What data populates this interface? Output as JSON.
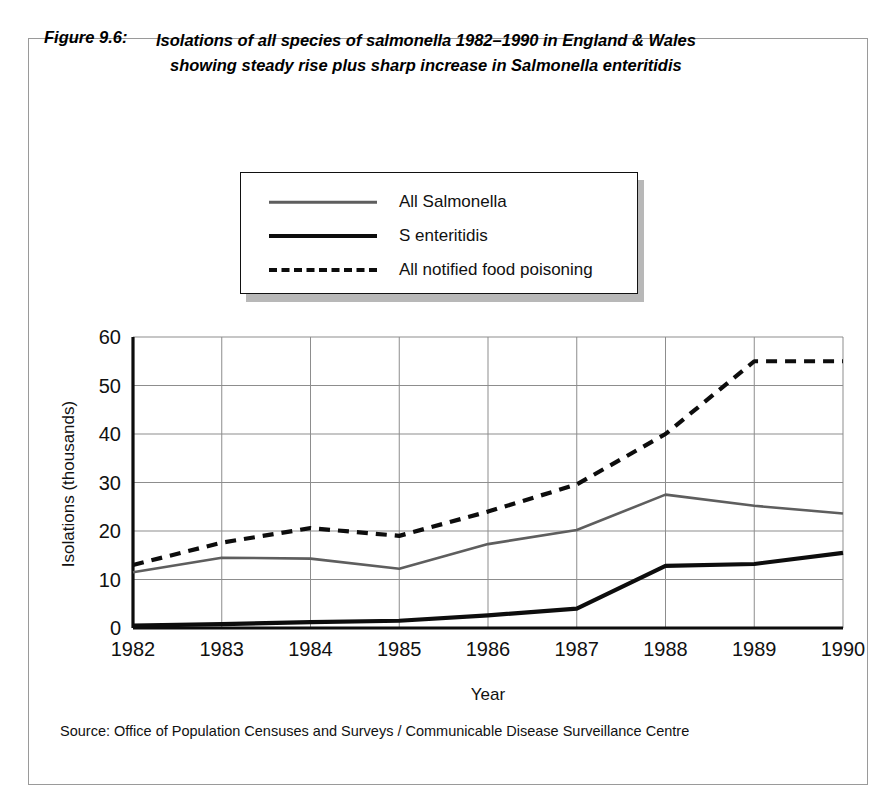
{
  "figure": {
    "number_label": "Figure 9.6:",
    "title_line_1": "Isolations of all species of salmonella 1982–1990 in England & Wales",
    "title_line_2": "showing  steady rise plus sharp increase in Salmonella enteritidis",
    "source_note": "Source: Office of Population Censuses and Surveys / Communicable Disease Surveillance Centre"
  },
  "legend": {
    "position": "above-plot",
    "items": [
      {
        "label": "All Salmonella",
        "style": "solid",
        "color": "#5e5e5e",
        "width": 2.5
      },
      {
        "label": "S enteritidis",
        "style": "solid",
        "color": "#0d0d0d",
        "width": 4
      },
      {
        "label": "All notified food poisoning",
        "style": "dashed",
        "color": "#0d0d0d",
        "width": 4
      }
    ]
  },
  "chart_data": {
    "type": "line",
    "title": "Isolations of all species of salmonella 1982–1990 in England & Wales showing  steady rise plus sharp increase in Salmonella enteritidis",
    "xlabel": "Year",
    "ylabel": "Isolations (thousands)",
    "x": [
      1982,
      1983,
      1984,
      1985,
      1986,
      1987,
      1988,
      1989,
      1990
    ],
    "categories": [
      "1982",
      "1983",
      "1984",
      "1985",
      "1986",
      "1987",
      "1988",
      "1989",
      "1990"
    ],
    "xlim": [
      1982,
      1990
    ],
    "ylim": [
      0,
      60
    ],
    "yticks": [
      0,
      10,
      20,
      30,
      40,
      50,
      60
    ],
    "ytick_labels": [
      "0",
      "10",
      "20",
      "30",
      "40",
      "50",
      "60"
    ],
    "grid": true,
    "legend_position": "above plot area",
    "series": [
      {
        "name": "All Salmonella",
        "style": "solid",
        "color": "#5e5e5e",
        "values": [
          11.5,
          14.5,
          14.3,
          12.2,
          17.3,
          20.2,
          27.5,
          25.2,
          23.6
        ]
      },
      {
        "name": "S enteritidis",
        "style": "solid",
        "color": "#0d0d0d",
        "values": [
          0.5,
          0.8,
          1.2,
          1.5,
          2.6,
          4.0,
          12.8,
          13.2,
          15.5
        ]
      },
      {
        "name": "All notified food poisoning",
        "style": "dashed",
        "color": "#0d0d0d",
        "values": [
          13.0,
          17.6,
          20.6,
          19.0,
          24.0,
          29.6,
          40.0,
          55.0,
          55.0
        ]
      }
    ]
  }
}
